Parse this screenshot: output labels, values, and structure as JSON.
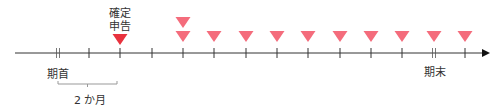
{
  "diagram": {
    "type": "timeline",
    "axis": {
      "x_start": 15,
      "x_end": 490,
      "y": 53,
      "color": "#333333"
    },
    "ticks": [
      {
        "x": 58,
        "double": true
      },
      {
        "x": 89,
        "double": false
      },
      {
        "x": 120,
        "double": false
      },
      {
        "x": 152,
        "double": false
      },
      {
        "x": 183,
        "double": false
      },
      {
        "x": 214,
        "double": false
      },
      {
        "x": 246,
        "double": false
      },
      {
        "x": 277,
        "double": false
      },
      {
        "x": 308,
        "double": false
      },
      {
        "x": 340,
        "double": false
      },
      {
        "x": 371,
        "double": false
      },
      {
        "x": 402,
        "double": false
      },
      {
        "x": 434,
        "double": true
      },
      {
        "x": 465,
        "double": false
      }
    ],
    "markers": [
      {
        "x": 120,
        "y": 34,
        "color": "#e8323e",
        "kind": "final-return"
      },
      {
        "x": 183,
        "y": 17,
        "color": "#f46c7c",
        "kind": "payment"
      },
      {
        "x": 183,
        "y": 31,
        "color": "#f46c7c",
        "kind": "payment"
      },
      {
        "x": 214,
        "y": 31,
        "color": "#f46c7c",
        "kind": "payment"
      },
      {
        "x": 246,
        "y": 31,
        "color": "#f46c7c",
        "kind": "payment"
      },
      {
        "x": 277,
        "y": 31,
        "color": "#f46c7c",
        "kind": "payment"
      },
      {
        "x": 308,
        "y": 31,
        "color": "#f46c7c",
        "kind": "payment"
      },
      {
        "x": 340,
        "y": 31,
        "color": "#f46c7c",
        "kind": "payment"
      },
      {
        "x": 371,
        "y": 31,
        "color": "#f46c7c",
        "kind": "payment"
      },
      {
        "x": 402,
        "y": 31,
        "color": "#f46c7c",
        "kind": "payment"
      },
      {
        "x": 434,
        "y": 31,
        "color": "#f46c7c",
        "kind": "payment"
      },
      {
        "x": 465,
        "y": 31,
        "color": "#f46c7c",
        "kind": "payment"
      }
    ],
    "labels": {
      "kakutei_line1": "確定",
      "kakutei_line2": "申告",
      "period_start": "期首",
      "period_end": "期末",
      "interval": "2 か月"
    },
    "bracket": {
      "x1": 58,
      "x2": 117,
      "y": 84,
      "color": "#999999"
    }
  }
}
